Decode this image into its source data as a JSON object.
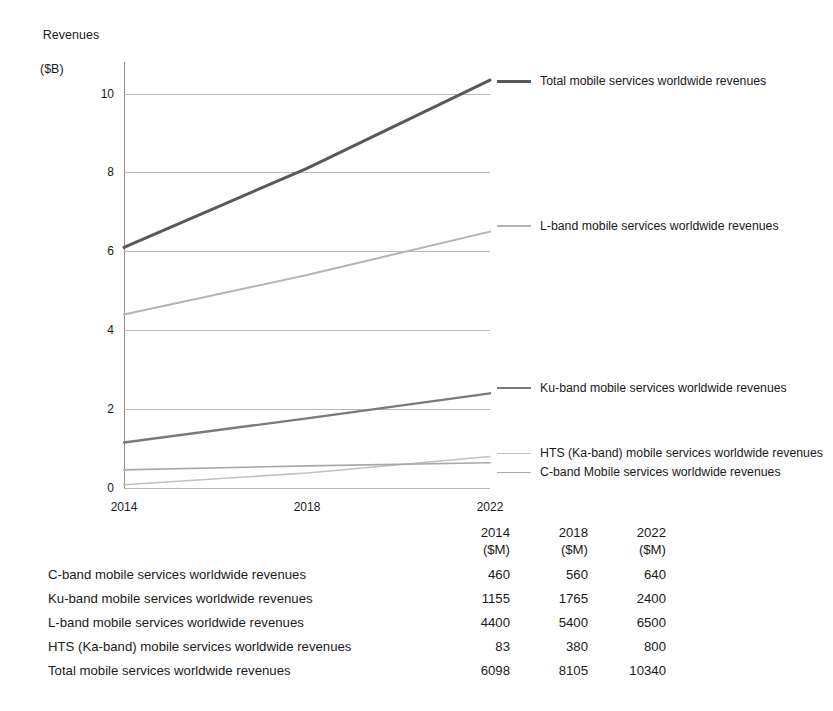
{
  "chart_data": {
    "type": "line",
    "title": "",
    "xlabel": "",
    "ylabel": "Revenues",
    "ylabel_unit": "($B)",
    "x": [
      2014,
      2018,
      2022
    ],
    "xtick_labels": [
      "2014",
      "2018",
      "2022"
    ],
    "ytick_labels": [
      "0",
      "2",
      "4",
      "6",
      "8",
      "10"
    ],
    "yticks": [
      0,
      2,
      4,
      6,
      8,
      10
    ],
    "ylim": [
      0,
      10.8
    ],
    "xlim": [
      2014,
      2022
    ],
    "grid": true,
    "legend_position": "right",
    "series": [
      {
        "name": "Total mobile services worldwide revenues",
        "values": [
          6.098,
          8.105,
          10.34
        ],
        "color": "#595959",
        "width": 3.0
      },
      {
        "name": "L-band mobile services worldwide revenues",
        "values": [
          4.4,
          5.4,
          6.5
        ],
        "color": "#b4b4b4",
        "width": 2.0
      },
      {
        "name": "Ku-band mobile services worldwide revenues",
        "values": [
          1.155,
          1.765,
          2.4
        ],
        "color": "#7a7a7a",
        "width": 2.4
      },
      {
        "name": "HTS (Ka-band) mobile services worldwide revenues",
        "values": [
          0.083,
          0.38,
          0.8
        ],
        "color": "#c0c0c0",
        "width": 1.6
      },
      {
        "name": "C-band Mobile services worldwide revenues",
        "values": [
          0.46,
          0.56,
          0.64
        ],
        "color": "#a8a8a8",
        "width": 1.6
      }
    ]
  },
  "legend": {
    "items": [
      {
        "label": "Total mobile services worldwide revenues",
        "color": "#595959",
        "thickness": "3px",
        "top": 74
      },
      {
        "label": "L-band mobile services worldwide revenues",
        "color": "#b4b4b4",
        "thickness": "2px",
        "top": 219
      },
      {
        "label": "Ku-band mobile services worldwide revenues",
        "color": "#7a7a7a",
        "thickness": "2px",
        "top": 381
      },
      {
        "label": "HTS (Ka-band) mobile services worldwide revenues",
        "color": "#c0c0c0",
        "thickness": "1px",
        "top": 446
      },
      {
        "label": "C-band Mobile services worldwide revenues",
        "color": "#a8a8a8",
        "thickness": "1px",
        "top": 465
      }
    ]
  },
  "table": {
    "columns": [
      {
        "year": "2014",
        "unit": "($M)"
      },
      {
        "year": "2018",
        "unit": "($M)"
      },
      {
        "year": "2022",
        "unit": "($M)"
      }
    ],
    "rows": [
      {
        "label": "C-band mobile services worldwide revenues",
        "values": [
          "460",
          "560",
          "640"
        ]
      },
      {
        "label": "Ku-band mobile services worldwide revenues",
        "values": [
          "1155",
          "1765",
          "2400"
        ]
      },
      {
        "label": "L-band mobile services worldwide revenues",
        "values": [
          "4400",
          "5400",
          "6500"
        ]
      },
      {
        "label": "HTS (Ka-band) mobile services worldwide revenues",
        "values": [
          "83",
          "380",
          "800"
        ]
      },
      {
        "label": "Total mobile services worldwide revenues",
        "values": [
          "6098",
          "8105",
          "10340"
        ]
      }
    ]
  },
  "caption": {
    "text": ""
  },
  "colors": {
    "grid": "#b9b9b9",
    "axis": "#8f8f8f",
    "text": "#1a1a1a"
  }
}
